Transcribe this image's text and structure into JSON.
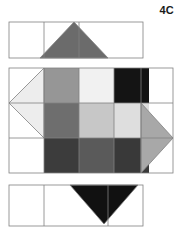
{
  "figure": {
    "label": "4C",
    "background_color": "#ffffff",
    "stroke_color": "#808080",
    "stroke_width": 0.8,
    "canvas": {
      "width": 181,
      "height": 235
    }
  },
  "top_strip": {
    "name": "top-strip",
    "x": 9,
    "y": 22,
    "cell_width": 35,
    "cell_height": 36,
    "cell_count": 3,
    "cells": [
      {
        "index": 0,
        "fill": "#ffffff"
      },
      {
        "index": 1,
        "fill": "#ffffff"
      },
      {
        "index": 2,
        "fill": "#ffffff"
      }
    ],
    "shape": {
      "name": "up-triangle",
      "direction": "up",
      "fill": "#6b6b6b",
      "cell_index": 1,
      "span_cells": 2,
      "points": "74,22 108,58 40,58"
    }
  },
  "middle_panel": {
    "name": "middle-panel",
    "x": 9,
    "y": 68,
    "width": 164,
    "height": 105,
    "row_height": 35,
    "col_edges": [
      9,
      44,
      79,
      114,
      141,
      173
    ],
    "grid": {
      "name": "center-grid",
      "x": 44,
      "y": 68,
      "cell_size": 35,
      "rows": 3,
      "cols": 3,
      "cells": [
        [
          {
            "row": 0,
            "col": 0,
            "fill": "#969696",
            "shade": "medium-light-gray"
          },
          {
            "row": 0,
            "col": 1,
            "fill": "#f1f1f1",
            "shade": "near-white"
          },
          {
            "row": 0,
            "col": 2,
            "fill": "#141414",
            "shade": "near-black"
          }
        ],
        [
          {
            "row": 1,
            "col": 0,
            "fill": "#6e6e6e",
            "shade": "medium-gray"
          },
          {
            "row": 1,
            "col": 1,
            "fill": "#c7c7c7",
            "shade": "light-gray"
          },
          {
            "row": 1,
            "col": 2,
            "fill": "#dedede",
            "shade": "very-light-gray"
          }
        ],
        [
          {
            "row": 2,
            "col": 0,
            "fill": "#3c3c3c",
            "shade": "dark-gray"
          },
          {
            "row": 2,
            "col": 1,
            "fill": "#5a5a5a",
            "shade": "medium-dark-gray"
          },
          {
            "row": 2,
            "col": 2,
            "fill": "#393939",
            "shade": "dark-gray"
          }
        ]
      ]
    },
    "side_cells": [
      {
        "name": "left-upper-cell",
        "x": 9,
        "y": 68,
        "w": 35,
        "h": 35,
        "fill": "#ffffff"
      },
      {
        "name": "left-middle-cell",
        "x": 9,
        "y": 103,
        "w": 35,
        "h": 35,
        "fill": "#ffffff"
      },
      {
        "name": "left-lower-cell",
        "x": 9,
        "y": 138,
        "w": 35,
        "h": 35,
        "fill": "#ffffff"
      },
      {
        "name": "right-upper-cell",
        "x": 141,
        "y": 68,
        "w": 32,
        "h": 35,
        "fill": "#ffffff"
      },
      {
        "name": "right-middle-cell",
        "x": 141,
        "y": 103,
        "w": 32,
        "h": 35,
        "fill": "#ffffff"
      },
      {
        "name": "right-lower-cell",
        "x": 141,
        "y": 138,
        "w": 32,
        "h": 35,
        "fill": "#ffffff"
      }
    ],
    "left_shape": {
      "name": "left-triangle",
      "direction": "left",
      "fill": "#ededed",
      "points": "44,68 44,138 9,103"
    },
    "right_shape": {
      "name": "right-triangle",
      "direction": "right",
      "fill": "#a8a8a8",
      "points": "141,103 141,173 173,138"
    }
  },
  "bottom_strip": {
    "name": "bottom-strip",
    "x": 9,
    "y": 185,
    "cell_width": 35,
    "cell_height": 41,
    "cell_count": 3,
    "cells": [
      {
        "index": 0,
        "fill": "#ffffff"
      },
      {
        "index": 1,
        "fill": "#ffffff"
      },
      {
        "index": 2,
        "fill": "#ffffff"
      }
    ],
    "shape": {
      "name": "down-triangle",
      "direction": "down",
      "fill": "#111111",
      "cell_index": 1,
      "span_cells": 2,
      "points": "70,185 138,185 104,224"
    }
  }
}
